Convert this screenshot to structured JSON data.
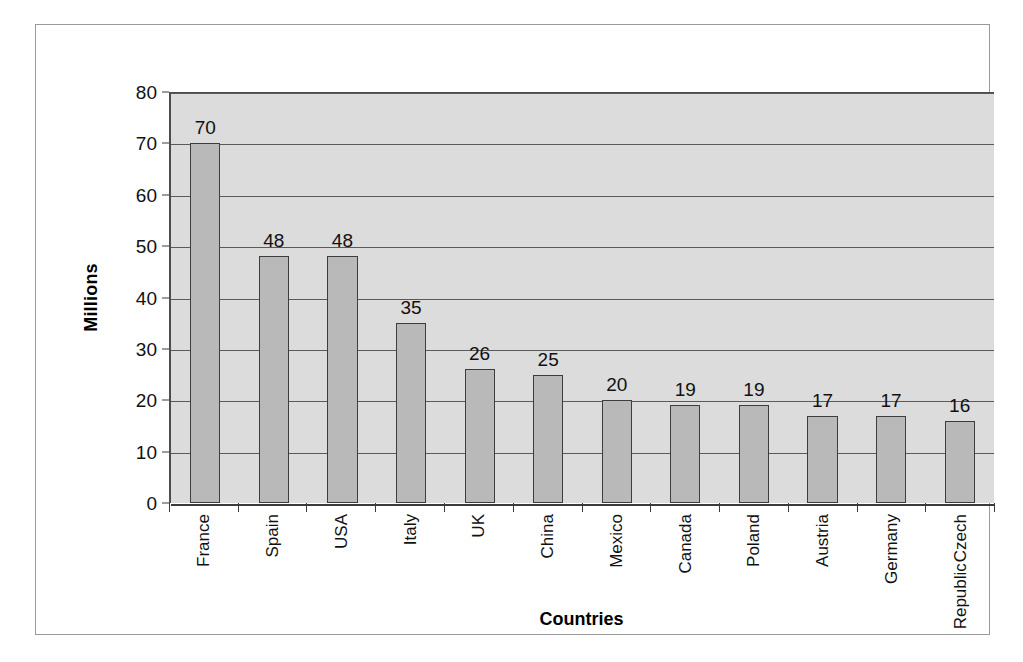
{
  "chart_data": {
    "type": "bar",
    "title": "",
    "xlabel": "Countries",
    "ylabel": "Millions",
    "categories": [
      "France",
      "Spain",
      "USA",
      "Italy",
      "UK",
      "China",
      "Mexico",
      "Canada",
      "Poland",
      "Austria",
      "Germany",
      "Czech Republic"
    ],
    "values": [
      70,
      48,
      48,
      35,
      26,
      25,
      20,
      19,
      19,
      17,
      17,
      16
    ],
    "value_labels": [
      "70",
      "48",
      "48",
      "35",
      "26",
      "25",
      "20",
      "19",
      "19",
      "17",
      "17",
      "16"
    ],
    "ylim": [
      0,
      80
    ],
    "ytick_labels": [
      "80",
      "70",
      "60",
      "50",
      "40",
      "30",
      "20",
      "10",
      "0"
    ],
    "yticks": [
      80,
      70,
      60,
      50,
      40,
      30,
      20,
      10,
      0
    ],
    "grid": true,
    "legend": "none",
    "bar_color": "#b9b9b9",
    "bar_border_color": "#3d3d3d",
    "plot_background": "#dcdcdc",
    "grid_color": "#5a5a5a",
    "axis_color": "#3a3a3a",
    "x_label_rotation": -90,
    "multiline_categories": {
      "Czech Republic": [
        "Czech",
        "Republic"
      ]
    }
  }
}
